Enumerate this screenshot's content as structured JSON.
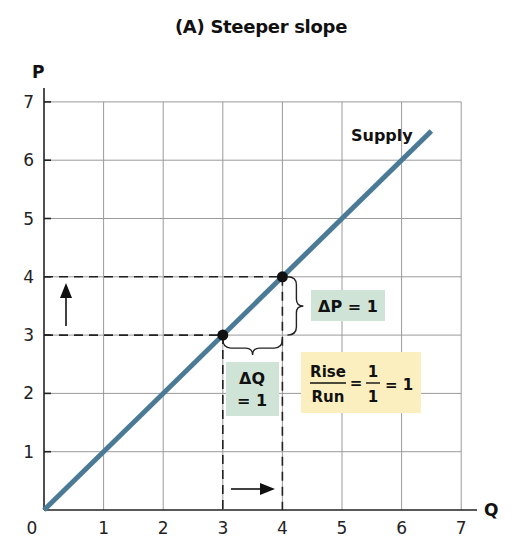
{
  "title": "(A) Steeper slope",
  "chart_data": {
    "type": "line",
    "title": "(A) Steeper slope",
    "xlabel": "Q",
    "ylabel": "P",
    "xlim": [
      0,
      7
    ],
    "ylim": [
      0,
      7
    ],
    "x_ticks": [
      "0",
      "1",
      "2",
      "3",
      "4",
      "5",
      "6",
      "7"
    ],
    "y_ticks": [
      "1",
      "2",
      "3",
      "4",
      "5",
      "6",
      "7"
    ],
    "grid": true,
    "series": [
      {
        "name": "Supply",
        "color": "#4a7a96",
        "x": [
          0,
          6.5
        ],
        "y": [
          0,
          6.5
        ]
      }
    ],
    "points": [
      {
        "x": 3,
        "y": 3
      },
      {
        "x": 4,
        "y": 4
      }
    ],
    "annotations": [
      {
        "text": "ΔP = 1",
        "bg": "#cfe3d6"
      },
      {
        "text_line1": "ΔQ",
        "text_line2": "= 1",
        "bg": "#cfe3d6"
      },
      {
        "rise": "Rise",
        "run": "Run",
        "num": "1",
        "den": "1",
        "result": "= 1",
        "bg": "#fbefc0"
      }
    ]
  },
  "labels": {
    "supply": "Supply",
    "dp": "ΔP = 1",
    "dq1": "ΔQ",
    "dq2": "= 1",
    "rise": "Rise",
    "run": "Run",
    "num": "1",
    "den": "1",
    "eq1": "=",
    "eq2": "= 1"
  }
}
